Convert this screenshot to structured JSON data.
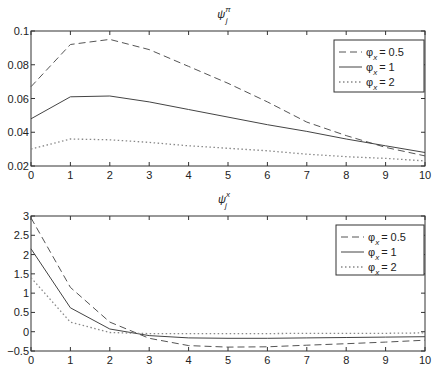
{
  "chart_data": [
    {
      "type": "line",
      "title": "ψ_j^π",
      "title_main": "ψ",
      "title_sub": "j",
      "title_sup": "π",
      "xlabel": "",
      "ylabel": "",
      "x": [
        0,
        1,
        2,
        3,
        4,
        5,
        6,
        7,
        8,
        9,
        10
      ],
      "xlim": [
        0,
        10
      ],
      "ylim": [
        0.02,
        0.1
      ],
      "xticks": [
        "0",
        "1",
        "2",
        "3",
        "4",
        "5",
        "6",
        "7",
        "8",
        "9",
        "10"
      ],
      "yticks": [
        "0.02",
        "0.04",
        "0.06",
        "0.08",
        "0.1"
      ],
      "ytick_values": [
        0.02,
        0.04,
        0.06,
        0.08,
        0.1
      ],
      "grid": false,
      "legend_position": "upper right",
      "series": [
        {
          "name": "φx = 0.5",
          "legend_label": "= 0.5",
          "style": "dashed",
          "values": [
            0.067,
            0.092,
            0.095,
            0.089,
            0.079,
            0.069,
            0.058,
            0.046,
            0.038,
            0.031,
            0.026
          ]
        },
        {
          "name": "φx = 1",
          "legend_label": "= 1",
          "style": "solid",
          "values": [
            0.048,
            0.061,
            0.0615,
            0.058,
            0.0535,
            0.049,
            0.0445,
            0.0405,
            0.036,
            0.032,
            0.028
          ]
        },
        {
          "name": "φx = 2",
          "legend_label": "= 2",
          "style": "dotted",
          "values": [
            0.03,
            0.036,
            0.0355,
            0.034,
            0.032,
            0.0305,
            0.029,
            0.027,
            0.0255,
            0.0245,
            0.023
          ]
        }
      ]
    },
    {
      "type": "line",
      "title": "ψ_j^x",
      "title_main": "ψ",
      "title_sub": "j",
      "title_sup": "x",
      "xlabel": "",
      "ylabel": "",
      "x": [
        0,
        1,
        2,
        3,
        4,
        5,
        6,
        7,
        8,
        9,
        10
      ],
      "xlim": [
        0,
        10
      ],
      "ylim": [
        -0.5,
        3
      ],
      "xticks": [
        "0",
        "1",
        "2",
        "3",
        "4",
        "5",
        "6",
        "7",
        "8",
        "9",
        "10"
      ],
      "yticks": [
        "-0.5",
        "0",
        "0.5",
        "1",
        "1.5",
        "2",
        "2.5",
        "3"
      ],
      "ytick_values": [
        -0.5,
        0,
        0.5,
        1,
        1.5,
        2,
        2.5,
        3
      ],
      "grid": false,
      "legend_position": "upper right",
      "series": [
        {
          "name": "φx = 0.5",
          "legend_label": "= 0.5",
          "style": "dashed",
          "values": [
            2.95,
            1.15,
            0.25,
            -0.17,
            -0.36,
            -0.4,
            -0.39,
            -0.35,
            -0.31,
            -0.27,
            -0.22
          ]
        },
        {
          "name": "φx = 1",
          "legend_label": "= 1",
          "style": "solid",
          "values": [
            2.15,
            0.62,
            0.07,
            -0.1,
            -0.16,
            -0.17,
            -0.17,
            -0.16,
            -0.15,
            -0.14,
            -0.13
          ]
        },
        {
          "name": "φx = 2",
          "legend_label": "= 2",
          "style": "dotted",
          "values": [
            1.4,
            0.25,
            -0.02,
            -0.05,
            -0.05,
            -0.05,
            -0.05,
            -0.04,
            -0.04,
            -0.04,
            -0.03
          ]
        }
      ]
    }
  ],
  "legend_symbol": "φ",
  "legend_subscript": "x",
  "colors": {
    "axis": "#333333",
    "dashed": "#555555",
    "solid": "#444444",
    "dotted": "#888888"
  }
}
